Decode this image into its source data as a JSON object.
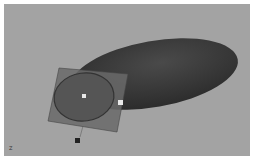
{
  "viewport": {
    "camera_label": "persp",
    "axis_indicator": "Z",
    "background_color": "#a3a3a3",
    "object_color": "#3a3a3a"
  }
}
